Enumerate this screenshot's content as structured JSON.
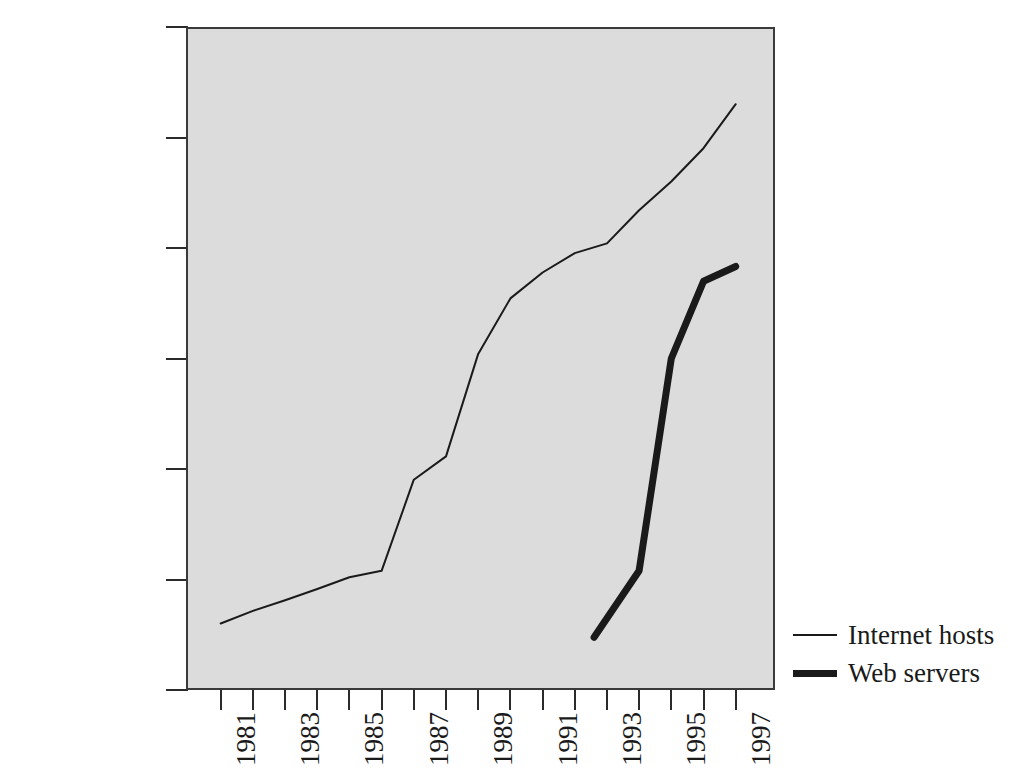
{
  "chart_data": {
    "type": "line",
    "title": "",
    "xlabel": "",
    "ylabel": "",
    "yscale": "log",
    "ylim": [
      100,
      100000000
    ],
    "xlim": [
      1981,
      1997
    ],
    "grid": false,
    "legend_position": "right-bottom-outside",
    "plot_background": "#dcdcdc",
    "axis_color": "#2b2b2b",
    "ytick_labels": [
      "100,000,000",
      "10,000,000",
      "1,000,000",
      "100,000",
      "10,000",
      "1,000",
      "100"
    ],
    "ytick_values": [
      100000000,
      10000000,
      1000000,
      100000,
      10000,
      1000,
      100
    ],
    "xtick_values": [
      1981,
      1982,
      1983,
      1984,
      1985,
      1986,
      1987,
      1988,
      1989,
      1990,
      1991,
      1992,
      1993,
      1994,
      1995,
      1996,
      1997
    ],
    "xtick_labels": [
      "1981",
      "",
      "1983",
      "",
      "1985",
      "",
      "1987",
      "",
      "1989",
      "",
      "1991",
      "",
      "1993",
      "",
      "1995",
      "",
      "1997"
    ],
    "series": [
      {
        "name": "Internet hosts",
        "line_style": "thin",
        "line_width": 2,
        "color": "#1a1a1a",
        "x": [
          1981,
          1982,
          1983,
          1984,
          1985,
          1986,
          1987,
          1988,
          1989,
          1990,
          1991,
          1992,
          1993,
          1994,
          1995,
          1996,
          1997
        ],
        "y": [
          400,
          520,
          650,
          820,
          1050,
          1200,
          8000,
          13000,
          110000,
          350000,
          600000,
          900000,
          1100000,
          2200000,
          4000000,
          8000000,
          20000000
        ]
      },
      {
        "name": "Web servers",
        "line_style": "thick",
        "line_width": 7,
        "color": "#1a1a1a",
        "x": [
          1992.6,
          1994,
          1995,
          1996,
          1997
        ],
        "y": [
          300,
          1200,
          100000,
          500000,
          680000
        ]
      }
    ]
  },
  "legend": {
    "items": [
      {
        "label": "Internet hosts",
        "style": "thin"
      },
      {
        "label": "Web servers",
        "style": "thick"
      }
    ]
  }
}
